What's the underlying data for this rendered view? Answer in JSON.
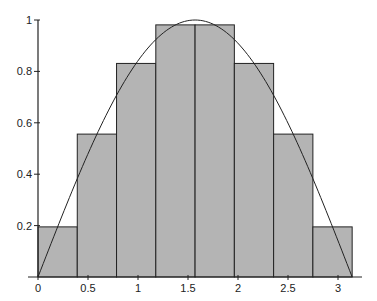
{
  "chart_data": {
    "type": "bar",
    "title": "",
    "xlabel": "",
    "ylabel": "",
    "bar_edges": [
      0,
      0.3927,
      0.7854,
      1.1781,
      1.5708,
      1.9635,
      2.3562,
      2.7489,
      3.1416
    ],
    "values": [
      0.195,
      0.556,
      0.831,
      0.981,
      0.981,
      0.831,
      0.556,
      0.195
    ],
    "series": [
      {
        "name": "rectangles",
        "type": "bar",
        "values": [
          0.195,
          0.556,
          0.831,
          0.981,
          0.981,
          0.831,
          0.556,
          0.195
        ]
      },
      {
        "name": "sin(x)",
        "type": "line",
        "domain": [
          0,
          3.1416
        ]
      }
    ],
    "xlim": [
      0,
      3.2
    ],
    "ylim": [
      0,
      1
    ],
    "x_ticks": [
      0,
      0.5,
      1,
      1.5,
      2,
      2.5,
      3
    ],
    "x_tick_labels": [
      "0",
      "0.5",
      "1",
      "1.5",
      "2",
      "2.5",
      "3"
    ],
    "y_ticks": [
      0.2,
      0.4,
      0.6,
      0.8,
      1
    ],
    "y_tick_labels": [
      "0.2",
      "0.4",
      "0.6",
      "0.8",
      "1"
    ],
    "grid": false,
    "legend": "none",
    "colors": {
      "bar_fill": "#b4b4b4",
      "line": "#222222",
      "axis": "#222222"
    }
  }
}
